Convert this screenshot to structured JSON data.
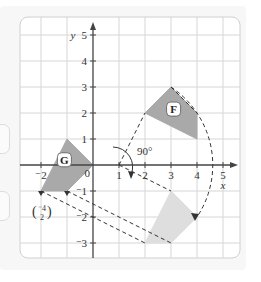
{
  "diagram": {
    "title": "",
    "x_axis": {
      "label": "x",
      "ticks": [
        -2,
        1,
        2,
        3,
        4,
        5
      ],
      "range": [
        -3,
        5
      ]
    },
    "y_axis": {
      "label": "y",
      "ticks": [
        5,
        4,
        3,
        2,
        1,
        -1,
        -2,
        -3
      ],
      "range": [
        -3,
        5
      ]
    },
    "origin_label": "0",
    "shapes": [
      {
        "name": "F",
        "label": "F",
        "vertices": [
          [
            2,
            2
          ],
          [
            3,
            3
          ],
          [
            4,
            2
          ],
          [
            4,
            1
          ]
        ],
        "fill": "#a9a9a9"
      },
      {
        "name": "G",
        "label": "G",
        "vertices": [
          [
            -1,
            1
          ],
          [
            0,
            0
          ],
          [
            -1,
            -1
          ],
          [
            -2,
            -1
          ]
        ],
        "fill": "#a9a9a9"
      },
      {
        "name": "image",
        "label": "",
        "vertices": [
          [
            3,
            -1
          ],
          [
            4,
            -2
          ],
          [
            3,
            -3
          ],
          [
            2,
            -3
          ]
        ],
        "fill": "#dedede"
      }
    ],
    "rotation": {
      "angle_label": "90°",
      "centre": [
        1,
        0
      ]
    },
    "translation_vector": {
      "top": "-4",
      "bottom": "2"
    },
    "colors": {
      "grid": "#d6d6d6",
      "axis": "#444444",
      "shape": "#a9a9a9",
      "image": "#dedede",
      "dash": "#333333"
    }
  },
  "chart_data": {
    "type": "scatter",
    "title": "",
    "xlabel": "x",
    "ylabel": "y",
    "xlim": [
      -3,
      5
    ],
    "ylim": [
      -3,
      5
    ],
    "grid": true,
    "series": [
      {
        "name": "F",
        "points": [
          [
            2,
            2
          ],
          [
            3,
            3
          ],
          [
            4,
            2
          ],
          [
            4,
            1
          ]
        ]
      },
      {
        "name": "G",
        "points": [
          [
            -1,
            1
          ],
          [
            0,
            0
          ],
          [
            -1,
            -1
          ],
          [
            -2,
            -1
          ]
        ]
      },
      {
        "name": "image",
        "points": [
          [
            3,
            -1
          ],
          [
            4,
            -2
          ],
          [
            3,
            -3
          ],
          [
            2,
            -3
          ]
        ]
      }
    ],
    "annotations": [
      "90°",
      "(-4, 2) translation vector",
      "F",
      "G"
    ]
  }
}
